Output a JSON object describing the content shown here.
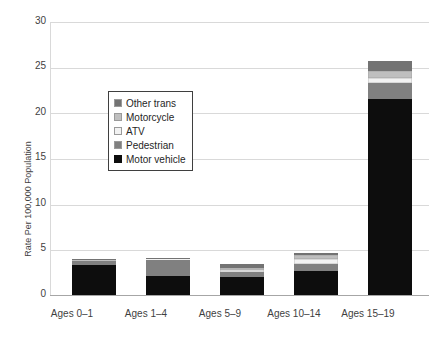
{
  "chart_data": {
    "type": "bar",
    "subtype": "stacked-bar",
    "title": "",
    "xlabel": "",
    "ylabel": "Rate Per 100,000 Population",
    "ylim": [
      0,
      30
    ],
    "yticks": [
      0,
      5,
      10,
      15,
      20,
      25,
      30
    ],
    "ytick_labels": [
      "0",
      "5",
      "10",
      "15",
      "20",
      "25",
      "30"
    ],
    "grid": true,
    "legend_position": "upper left inside plot",
    "categories": [
      "Ages 0–1",
      "Ages 1–4",
      "Ages 5–9",
      "Ages 10–14",
      "Ages 15–19"
    ],
    "series": [
      {
        "name": "Motor vehicle",
        "color": "#0d0d0d",
        "values": [
          3.4,
          2.2,
          2.1,
          2.7,
          21.6
        ]
      },
      {
        "name": "Pedestrian",
        "color": "#808080",
        "values": [
          0.5,
          1.8,
          0.5,
          0.8,
          1.7
        ]
      },
      {
        "name": "ATV",
        "color": "#f2f2f2",
        "values": [
          0.0,
          0.05,
          0.3,
          0.5,
          0.6
        ]
      },
      {
        "name": "Motorcycle",
        "color": "#bfbfbf",
        "values": [
          0.05,
          0.1,
          0.2,
          0.5,
          0.7
        ]
      },
      {
        "name": "Other trans",
        "color": "#737373",
        "values": [
          0.05,
          0.05,
          0.4,
          0.2,
          1.1
        ]
      }
    ],
    "totals": [
      4.0,
      4.2,
      3.5,
      4.7,
      25.7
    ]
  },
  "legend": {
    "items": [
      {
        "label": "Other trans",
        "swatch": "legend-swatch-other-trans"
      },
      {
        "label": "Motorcycle",
        "swatch": "legend-swatch-motorcycle"
      },
      {
        "label": "ATV",
        "swatch": "legend-swatch-atv"
      },
      {
        "label": "Pedestrian",
        "swatch": "legend-swatch-pedestrian"
      },
      {
        "label": "Motor vehicle",
        "swatch": "legend-swatch-motor-vehicle"
      }
    ]
  },
  "colors": {
    "motor_vehicle": "#0d0d0d",
    "pedestrian": "#808080",
    "atv": "#f2f2f2",
    "motorcycle": "#bfbfbf",
    "other_trans": "#737373",
    "gridline": "#d9d9d9",
    "axis": "#a6a6a6",
    "text": "#3f3f3f"
  }
}
